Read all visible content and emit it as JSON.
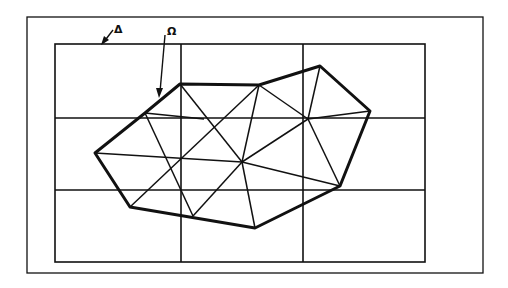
{
  "figure": {
    "labels": {
      "delta": "Δ",
      "omega": "Ω"
    },
    "colors": {
      "ink": "#111111",
      "background": "#ffffff"
    },
    "outer_frame": {
      "x": 27,
      "y": 17,
      "width": 456,
      "height": 256
    },
    "grid": {
      "x": 55,
      "y": 44,
      "width": 370,
      "height": 218,
      "vertical_lines_x": [
        181,
        303
      ],
      "horizontal_lines_y": [
        118,
        190
      ],
      "columns": 3,
      "rows": 3
    },
    "domain_polygon": {
      "name": "Ω",
      "vertices": [
        [
          95,
          153
        ],
        [
          145,
          113
        ],
        [
          180,
          84
        ],
        [
          259,
          85
        ],
        [
          320,
          66
        ],
        [
          370,
          111
        ],
        [
          340,
          186
        ],
        [
          255,
          228
        ],
        [
          130,
          207
        ]
      ]
    },
    "interior_vertices": {
      "J": [
        204,
        119
      ],
      "K": [
        168,
        161
      ],
      "L": [
        242,
        162
      ],
      "N": [
        308,
        119
      ],
      "M": [
        193,
        216
      ]
    },
    "triangulation_edges": [
      [
        [
          145,
          113
        ],
        [
          204,
          119
        ]
      ],
      [
        [
          180,
          84
        ],
        [
          242,
          162
        ]
      ],
      [
        [
          259,
          85
        ],
        [
          130,
          207
        ]
      ],
      [
        [
          145,
          113
        ],
        [
          193,
          216
        ]
      ],
      [
        [
          95,
          153
        ],
        [
          242,
          162
        ]
      ],
      [
        [
          259,
          85
        ],
        [
          242,
          162
        ]
      ],
      [
        [
          259,
          85
        ],
        [
          308,
          119
        ]
      ],
      [
        [
          320,
          66
        ],
        [
          308,
          119
        ]
      ],
      [
        [
          242,
          162
        ],
        [
          308,
          119
        ]
      ],
      [
        [
          308,
          119
        ],
        [
          370,
          111
        ]
      ],
      [
        [
          308,
          119
        ],
        [
          340,
          186
        ]
      ],
      [
        [
          242,
          162
        ],
        [
          340,
          186
        ]
      ],
      [
        [
          242,
          162
        ],
        [
          255,
          228
        ]
      ],
      [
        [
          242,
          162
        ],
        [
          193,
          216
        ]
      ]
    ],
    "arrows": {
      "delta": {
        "from": [
          113,
          30
        ],
        "to": [
          103,
          44
        ]
      },
      "omega": {
        "from": [
          165,
          35
        ],
        "to": [
          159,
          97
        ]
      }
    }
  }
}
